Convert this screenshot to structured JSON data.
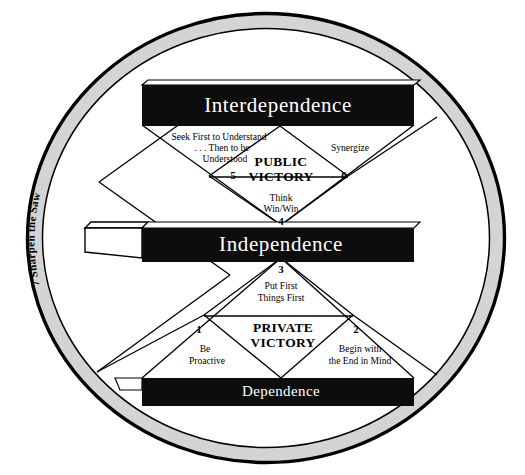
{
  "diagram": {
    "title_alt": "The 7 Habits Maturity Continuum",
    "colors": {
      "bar_fill": "#0d0d0d",
      "bar_text": "#ffffff",
      "ring_band": "#d4d4d4",
      "ring_outline": "#000000",
      "line": "#000000",
      "background": "#ffffff"
    },
    "levels": [
      {
        "id": "interdependence",
        "label": "Interdependence"
      },
      {
        "id": "independence",
        "label": "Independence"
      },
      {
        "id": "dependence",
        "label": "Dependence"
      }
    ],
    "victories": [
      {
        "id": "public-victory",
        "line1": "PUBLIC",
        "line2": "VICTORY"
      },
      {
        "id": "private-victory",
        "line1": "PRIVATE",
        "line2": "VICTORY"
      }
    ],
    "habits": [
      {
        "number": "1",
        "line1": "Be",
        "line2": "Proactive"
      },
      {
        "number": "2",
        "line1": "Begin with",
        "line2": "the End in Mind"
      },
      {
        "number": "3",
        "line1": "Put First",
        "line2": "Things First"
      },
      {
        "number": "4",
        "line1": "Think",
        "line2": "Win/Win"
      },
      {
        "number": "5",
        "line1": "Seek First to Understand",
        "line2": ". . . Then to be",
        "line3": "Understood"
      },
      {
        "number": "6",
        "line1": "Synergize"
      },
      {
        "number": "7",
        "line1": "Sharpen the Saw"
      }
    ],
    "ring_label": "7  Sharpen the Saw"
  }
}
